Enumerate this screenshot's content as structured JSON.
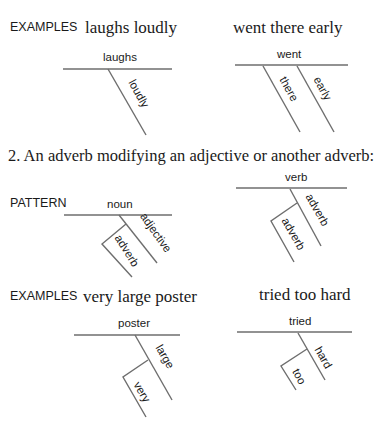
{
  "section1": {
    "examples_tag": "EXAMPLES",
    "example1": {
      "phrase": "laughs loudly",
      "head": "laughs",
      "modifier": "loudly"
    },
    "example2": {
      "phrase": "went there early",
      "head": "went",
      "modifiers": [
        "there",
        "early"
      ]
    }
  },
  "section2": {
    "heading": "2.  An adverb modifying an adjective or another adverb:",
    "pattern_tag": "PATTERN",
    "pattern1": {
      "head": "noun",
      "modifier": "adjective",
      "sub_modifier": "adverb"
    },
    "pattern2": {
      "head": "verb",
      "modifier": "adverb",
      "sub_modifier": "adverb"
    },
    "examples_tag": "EXAMPLES",
    "example1": {
      "phrase": "very large poster",
      "head": "poster",
      "modifier": "large",
      "sub_modifier": "very"
    },
    "example2": {
      "phrase": "tried too hard",
      "head": "tried",
      "modifier": "hard",
      "sub_modifier": "too"
    }
  },
  "colors": {
    "line": "#6e6e6e",
    "text": "#1a1a1a",
    "background": "#ffffff"
  }
}
